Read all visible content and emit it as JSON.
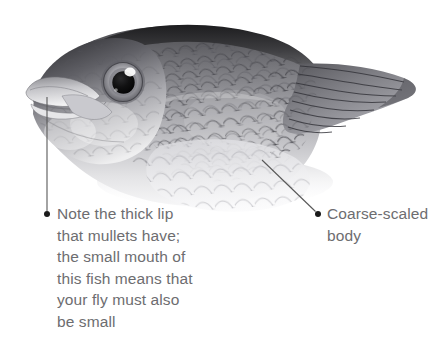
{
  "figure": {
    "medium": "graphite-pencil-drawing",
    "orientation": "facing-left",
    "background_color": "#ffffff",
    "text_color": "#6d6d70",
    "leader_line_color": "#585858",
    "bullet_color": "#1a1a1a"
  },
  "callouts": [
    {
      "id": "lip-callout",
      "text": "Note the thick lip\nthat mullets have;\nthe small mouth of\nthis fish means that\nyour fly must also\nbe small",
      "bullet": {
        "x": 47,
        "y": 214
      },
      "anchor": {
        "x": 47,
        "y": 97
      },
      "leader": "vertical"
    },
    {
      "id": "body-callout",
      "text": "Coarse-scaled\nbody",
      "bullet": {
        "x": 318,
        "y": 214
      },
      "anchor": {
        "x": 262,
        "y": 160
      },
      "leader": "diagonal"
    }
  ]
}
